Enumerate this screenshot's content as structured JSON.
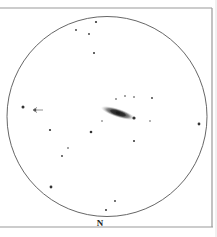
{
  "sketch": {
    "type": "eyepiece-sketch",
    "orientation_label": "N",
    "colors": {
      "background": "#ffffff",
      "frame": "#9a9a9a",
      "circle": "#555555",
      "star": "#333333",
      "galaxy_outer": "#b8b8b8",
      "galaxy_core": "#1a1a1a"
    },
    "frame": {
      "top_y": 8,
      "bottom_y": 227,
      "right_x": 212,
      "left_x": 0
    },
    "field_of_view": {
      "cx": 107,
      "cy": 116.5,
      "r": 100
    },
    "galaxy": {
      "cx": 118,
      "cy": 113,
      "rx": 18,
      "ry": 4.5,
      "angle_deg": 18
    },
    "pointer_arrow": {
      "x1": 43,
      "y1": 110,
      "x2": 33,
      "y2": 110,
      "direction": "left"
    },
    "north_label_pos": {
      "x": 100,
      "y": 226
    },
    "stars": [
      {
        "x": 96,
        "y": 22,
        "size": 1.1
      },
      {
        "x": 76,
        "y": 30,
        "size": 0.9
      },
      {
        "x": 89,
        "y": 34,
        "size": 0.9
      },
      {
        "x": 94,
        "y": 53,
        "size": 1.0
      },
      {
        "x": 116,
        "y": 99,
        "size": 0.8
      },
      {
        "x": 125,
        "y": 96,
        "size": 0.8
      },
      {
        "x": 134,
        "y": 97,
        "size": 0.8
      },
      {
        "x": 152,
        "y": 98,
        "size": 0.9
      },
      {
        "x": 134,
        "y": 118,
        "size": 1.6
      },
      {
        "x": 102,
        "y": 121,
        "size": 0.7
      },
      {
        "x": 150,
        "y": 121,
        "size": 0.7
      },
      {
        "x": 23,
        "y": 107,
        "size": 1.5
      },
      {
        "x": 35,
        "y": 110,
        "size": 1.3
      },
      {
        "x": 199,
        "y": 124,
        "size": 1.4
      },
      {
        "x": 50,
        "y": 130,
        "size": 1.1
      },
      {
        "x": 91,
        "y": 132,
        "size": 1.3
      },
      {
        "x": 134,
        "y": 141,
        "size": 1.0
      },
      {
        "x": 68,
        "y": 148,
        "size": 0.8
      },
      {
        "x": 62,
        "y": 156,
        "size": 0.9
      },
      {
        "x": 51,
        "y": 187,
        "size": 1.4
      },
      {
        "x": 115,
        "y": 201,
        "size": 0.9
      },
      {
        "x": 106,
        "y": 210,
        "size": 1.0
      }
    ]
  }
}
